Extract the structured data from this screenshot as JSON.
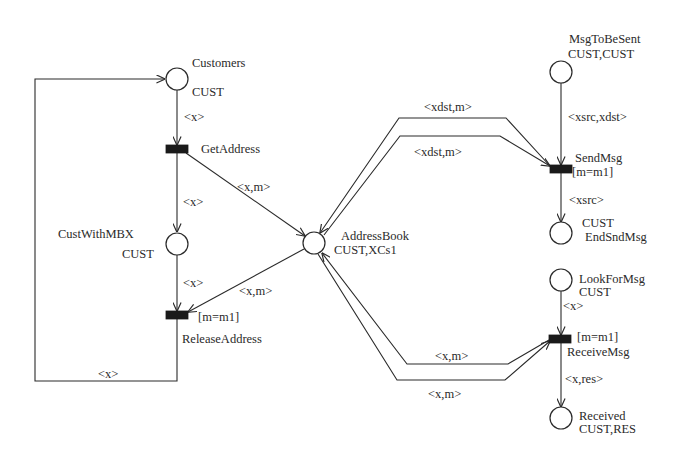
{
  "diagram": {
    "type": "colored-petri-net",
    "places": [
      {
        "id": "customers",
        "name": "Customers",
        "color_set": "CUST"
      },
      {
        "id": "custwithmbx",
        "name": "CustWithMBX",
        "color_set": "CUST"
      },
      {
        "id": "addressbook",
        "name": "AddressBook",
        "color_set": "CUST,XCs1"
      },
      {
        "id": "msgtobesent",
        "name": "MsgToBeSent",
        "color_set": "CUST,CUST"
      },
      {
        "id": "endsndmsg",
        "name": "EndSndMsg",
        "color_set": "CUST"
      },
      {
        "id": "lookformsg",
        "name": "LookForMsg",
        "color_set": "CUST"
      },
      {
        "id": "received",
        "name": "Received",
        "color_set": "CUST,RES"
      }
    ],
    "transitions": [
      {
        "id": "getaddress",
        "name": "GetAddress",
        "guard": ""
      },
      {
        "id": "releaseaddress",
        "name": "ReleaseAddress",
        "guard": "[m=m1]"
      },
      {
        "id": "sendmsg",
        "name": "SendMsg",
        "guard": "[m=m1]"
      },
      {
        "id": "receivemsg",
        "name": "ReceiveMsg",
        "guard": "[m=m1]"
      }
    ],
    "arcs": [
      {
        "from": "customers",
        "to": "getaddress",
        "label": "<x>"
      },
      {
        "from": "getaddress",
        "to": "custwithmbx",
        "label": "<x>"
      },
      {
        "from": "getaddress",
        "to": "addressbook",
        "label": "<x,m>"
      },
      {
        "from": "custwithmbx",
        "to": "releaseaddress",
        "label": "<x>"
      },
      {
        "from": "addressbook",
        "to": "releaseaddress",
        "label": "<x,m>"
      },
      {
        "from": "releaseaddress",
        "to": "customers",
        "label": "<x>"
      },
      {
        "from": "sendmsg",
        "to": "addressbook",
        "label": "<xdst,m>"
      },
      {
        "from": "addressbook",
        "to": "sendmsg",
        "label": "<xdst,m>"
      },
      {
        "from": "msgtobesent",
        "to": "sendmsg",
        "label": "<xsrc,xdst>"
      },
      {
        "from": "sendmsg",
        "to": "endsndmsg",
        "label": "<xsrc>"
      },
      {
        "from": "lookformsg",
        "to": "receivemsg",
        "label": "<x>"
      },
      {
        "from": "receivemsg",
        "to": "addressbook",
        "label": "<x,m>"
      },
      {
        "from": "addressbook",
        "to": "receivemsg",
        "label": "<x,m>"
      },
      {
        "from": "receivemsg",
        "to": "received",
        "label": "<x,res>"
      }
    ]
  },
  "labels": {
    "customers_name": "Customers",
    "customers_cs": "CUST",
    "custwithmbx_name": "CustWithMBX",
    "custwithmbx_cs": "CUST",
    "addressbook_name": "AddressBook",
    "addressbook_cs": "CUST,XCs1",
    "msgtobesent_name": "MsgToBeSent",
    "msgtobesent_cs": "CUST,CUST",
    "endsndmsg_cs": "CUST",
    "endsndmsg_name": "EndSndMsg",
    "lookformsg_name": "LookForMsg",
    "lookformsg_cs": "CUST",
    "received_name": "Received",
    "received_cs": "CUST,RES",
    "getaddress": "GetAddress",
    "releaseaddress_guard": "[m=m1]",
    "releaseaddress": "ReleaseAddress",
    "sendmsg": "SendMsg",
    "sendmsg_guard": "[m=m1]",
    "receivemsg_guard": "[m=m1]",
    "receivemsg": "ReceiveMsg",
    "arc_customers_getaddress": "<x>",
    "arc_getaddress_custwithmbx": "<x>",
    "arc_getaddress_addressbook": "<x,m>",
    "arc_custwithmbx_releaseaddress": "<x>",
    "arc_addressbook_releaseaddress": "<x,m>",
    "arc_loop_back": "<x>",
    "arc_sendmsg_addressbook_upper": "<xdst,m>",
    "arc_addressbook_sendmsg_lower": "<xdst,m>",
    "arc_msgtobesent_sendmsg": "<xsrc,xdst>",
    "arc_sendmsg_endsndmsg": "<xsrc>",
    "arc_lookformsg_receivemsg": "<x>",
    "arc_receivemsg_addressbook_upper": "<x,m>",
    "arc_addressbook_receivemsg_lower": "<x,m>",
    "arc_receivemsg_received": "<x,res>"
  }
}
